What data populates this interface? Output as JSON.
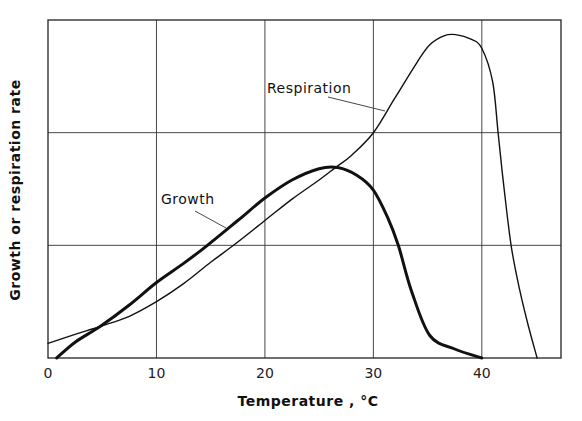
{
  "chart_data": {
    "type": "line",
    "title": "",
    "xlabel": "Temperature ,  °C",
    "ylabel": "Growth or respiration rate",
    "xlim": [
      0,
      47.3
    ],
    "ylim": [
      0,
      3
    ],
    "xticks": [
      0,
      10,
      20,
      30,
      40
    ],
    "xtick_labels": [
      "0",
      "10",
      "20",
      "30",
      "40"
    ],
    "ygrid": [
      1,
      2
    ],
    "grid": true,
    "legend": "none (inline labels)",
    "series": [
      {
        "name": "Growth",
        "label": "Growth",
        "line": "thick",
        "x": [
          0.8,
          2.5,
          4.8,
          7.5,
          10,
          12.5,
          14.7,
          17.5,
          20,
          22.5,
          25,
          26.7,
          28.5,
          30,
          31.3,
          32.3,
          33.5,
          35.2,
          37.5,
          40
        ],
        "y": [
          0,
          0.14,
          0.28,
          0.47,
          0.67,
          0.84,
          1.0,
          1.22,
          1.42,
          1.58,
          1.68,
          1.69,
          1.62,
          1.49,
          1.25,
          1.0,
          0.6,
          0.2,
          0.08,
          0
        ]
      },
      {
        "name": "Respiration",
        "label": "Respiration",
        "line": "thin",
        "x": [
          0,
          2.5,
          4.8,
          7.5,
          10,
          12.5,
          15,
          17.1,
          20,
          22.5,
          25,
          26.5,
          28,
          30,
          32,
          34,
          35.2,
          36.5,
          37.6,
          39,
          40,
          41,
          41.5,
          42,
          42.7,
          43.5,
          44.3,
          45.1
        ],
        "y": [
          0.13,
          0.21,
          0.28,
          0.37,
          0.5,
          0.66,
          0.85,
          1.0,
          1.22,
          1.41,
          1.58,
          1.69,
          1.8,
          2.0,
          2.31,
          2.62,
          2.78,
          2.86,
          2.87,
          2.83,
          2.75,
          2.45,
          2.0,
          1.55,
          1.0,
          0.6,
          0.28,
          0
        ]
      }
    ]
  }
}
